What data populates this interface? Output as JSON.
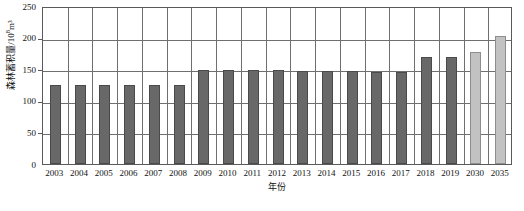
{
  "chart_data": {
    "type": "bar",
    "title": "",
    "xlabel": "年份",
    "ylabel": "森林蓄积量/10⁸m³",
    "ylabel_base": "森林蓄积量/10",
    "ylabel_exp": "8",
    "ylabel_unit": "m³",
    "categories": [
      "2003",
      "2004",
      "2005",
      "2006",
      "2007",
      "2008",
      "2009",
      "2010",
      "2011",
      "2012",
      "2013",
      "2014",
      "2015",
      "2016",
      "2017",
      "2018",
      "2019",
      "2030",
      "2035"
    ],
    "values": [
      125,
      125,
      125,
      125,
      125,
      125,
      148,
      148,
      148,
      148,
      147,
      147,
      147,
      145,
      145,
      170,
      170,
      177,
      202
    ],
    "kinds": [
      "historical",
      "historical",
      "historical",
      "historical",
      "historical",
      "historical",
      "historical",
      "historical",
      "historical",
      "historical",
      "historical",
      "historical",
      "historical",
      "historical",
      "historical",
      "historical",
      "historical",
      "projection",
      "projection"
    ],
    "ylim": [
      0,
      250
    ],
    "yticks": [
      0,
      50,
      100,
      150,
      200,
      250
    ],
    "ytick_labels": [
      "0",
      "50",
      "100",
      "150",
      "200",
      "250"
    ],
    "grid": "horizontal-and-vertical",
    "legend": "none",
    "colors": {
      "historical_bar": "#686868",
      "historical_bar_border": "#4a4a4a",
      "projection_bar": "#c2c2c2",
      "projection_bar_border": "#8d8d8d",
      "gridline": "#6f6f6f",
      "axis": "#5a5a5a",
      "text": "#111111",
      "background": "#ffffff"
    }
  }
}
